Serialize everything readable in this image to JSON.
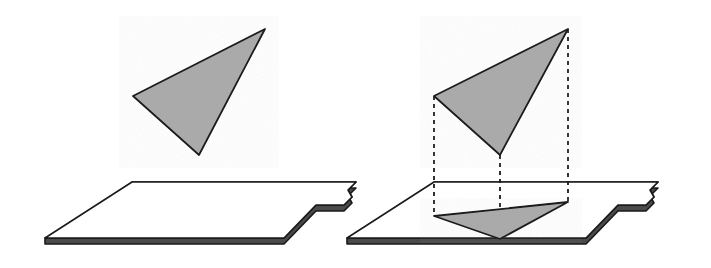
{
  "figure": {
    "title": "Orthogonal projection of a triangle onto a plane",
    "background_color": "#ffffff",
    "stroke_color": "#1a1a1a",
    "fill_gray": "#aaaaaa",
    "plane_fill": "#ffffff",
    "dash_color": "#1a1a1a",
    "stroke_width": 1.6,
    "panel_count": 2,
    "panels": [
      {
        "name": "triangle-above-plane",
        "caption": "",
        "has_projection_lines": false,
        "has_shadow": false,
        "triangle": {
          "name": "floating-triangle",
          "fill": "#aaaaaa",
          "vertices": [
            [
              265,
              29
            ],
            [
              133,
              96
            ],
            [
              199,
              155
            ]
          ]
        },
        "plane": {
          "name": "ground-plane",
          "fill": "#ffffff",
          "thickness": 6,
          "top_face": [
            [
              132,
              182
            ],
            [
              356,
              182
            ],
            [
              348,
              190
            ],
            [
              352,
              197
            ],
            [
              344,
              205
            ],
            [
              316,
              205
            ],
            [
              284,
              238
            ],
            [
              45,
              238
            ]
          ],
          "notch_description": "wavy S-curve tear along the right edge"
        }
      },
      {
        "name": "triangle-projected-onto-plane",
        "caption": "",
        "has_projection_lines": true,
        "has_shadow": true,
        "triangle": {
          "name": "floating-triangle",
          "fill": "#aaaaaa",
          "vertices": [
            [
              568,
              29
            ],
            [
              434,
              96
            ],
            [
              500,
              155
            ]
          ]
        },
        "shadow_triangle": {
          "name": "projected-triangle",
          "fill": "#aaaaaa",
          "vertices": [
            [
              568,
              202
            ],
            [
              434,
              216
            ],
            [
              500,
              239
            ]
          ]
        },
        "plane": {
          "name": "ground-plane",
          "fill": "#ffffff",
          "thickness": 6,
          "top_face": [
            [
              434,
              182
            ],
            [
              658,
              182
            ],
            [
              650,
              190
            ],
            [
              654,
              197
            ],
            [
              646,
              205
            ],
            [
              618,
              205
            ],
            [
              586,
              238
            ],
            [
              347,
              238
            ]
          ],
          "notch_description": "wavy S-curve tear along the right edge"
        },
        "projection_lines": [
          {
            "name": "projection-line-apex",
            "from": [
              568,
              29
            ],
            "to": [
              568,
              202
            ],
            "style": "dashed"
          },
          {
            "name": "projection-line-left",
            "from": [
              434,
              96
            ],
            "to": [
              434,
              216
            ],
            "style": "dashed"
          },
          {
            "name": "projection-line-bottom",
            "from": [
              500,
              155
            ],
            "to": [
              500,
              239
            ],
            "style": "dashed"
          }
        ],
        "dash_pattern": "4 4"
      }
    ]
  }
}
